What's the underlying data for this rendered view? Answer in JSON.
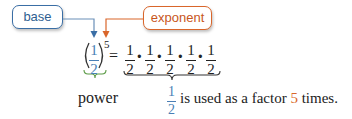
{
  "labels": {
    "base": "base",
    "exponent": "exponent",
    "power": "power"
  },
  "expression": {
    "base_numerator": "1",
    "base_denominator": "2",
    "exponent": "5",
    "equals": "=",
    "factors": [
      {
        "numerator": "1",
        "denominator": "2"
      },
      {
        "numerator": "1",
        "denominator": "2"
      },
      {
        "numerator": "1",
        "denominator": "2"
      },
      {
        "numerator": "1",
        "denominator": "2"
      },
      {
        "numerator": "1",
        "denominator": "2"
      }
    ],
    "operator": "·"
  },
  "caption": {
    "fraction_numerator": "1",
    "fraction_denominator": "2",
    "text_before": "is used as a factor",
    "count": "5",
    "text_after": "times."
  },
  "colors": {
    "base": "#3a6ea5",
    "exponent": "#d9662b",
    "power": "#5a9a45",
    "text": "#222222"
  }
}
